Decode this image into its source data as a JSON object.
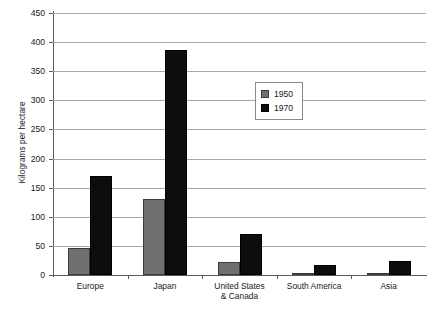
{
  "chart_data": {
    "type": "bar",
    "title": "",
    "xlabel": "",
    "ylabel": "Kilograms per hectare",
    "ylim": [
      0,
      450
    ],
    "yticks": [
      0,
      50,
      100,
      150,
      200,
      250,
      300,
      350,
      400,
      450
    ],
    "ytick_labels": [
      "0",
      "50",
      "100",
      "150",
      "200",
      "250",
      "300",
      "350",
      "400",
      "450"
    ],
    "grid": "horizontal",
    "legend_position": "inside-upper-right",
    "categories": [
      "Europe",
      "Japan",
      "United States\n& Canada",
      "South America",
      "Asia"
    ],
    "category_lines": [
      [
        "Europe"
      ],
      [
        "Japan"
      ],
      [
        "United States",
        "& Canada"
      ],
      [
        "South America"
      ],
      [
        "Asia"
      ]
    ],
    "series": [
      {
        "name": "1950",
        "color": "#707070",
        "values": [
          47,
          130,
          22,
          3,
          4
        ]
      },
      {
        "name": "1970",
        "color": "#0d0d0d",
        "values": [
          170,
          387,
          70,
          18,
          24
        ]
      }
    ]
  },
  "legend": {
    "entries": [
      {
        "label": "1950",
        "swatch": "gray-swatch"
      },
      {
        "label": "1970",
        "swatch": "black-swatch"
      }
    ]
  }
}
